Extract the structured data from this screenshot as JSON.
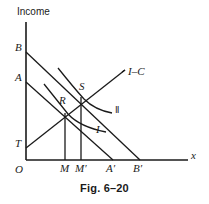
{
  "figure": {
    "caption": "Fig. 6–20",
    "axis_y_title": "Income",
    "axis_x_title": "x",
    "curve_labels": {
      "ic_line": "I–C",
      "indifference_one": "I",
      "indifference_two": "Ⅱ"
    },
    "points": [
      {
        "id": "B",
        "label": "B",
        "x": 15,
        "y": 48
      },
      {
        "id": "A",
        "label": "A",
        "x": 15,
        "y": 78
      },
      {
        "id": "T",
        "label": "T",
        "x": 15,
        "y": 144
      },
      {
        "id": "O",
        "label": "O",
        "x": 15,
        "y": 170
      },
      {
        "id": "S",
        "label": "S",
        "x": 79,
        "y": 87
      },
      {
        "id": "R",
        "label": "R",
        "x": 59,
        "y": 101
      },
      {
        "id": "M",
        "label": "M",
        "x": 60,
        "y": 169
      },
      {
        "id": "Mp",
        "label": "M′",
        "x": 76,
        "y": 169
      },
      {
        "id": "Ap",
        "label": "A′",
        "x": 107,
        "y": 169
      },
      {
        "id": "Bp",
        "label": "B′",
        "x": 134,
        "y": 169
      }
    ],
    "geometry": {
      "origin": {
        "x": 26,
        "y": 160
      },
      "y_axis_top": 22,
      "x_axis_right": 188,
      "budget_line_B": {
        "x1": 26,
        "y1": 52,
        "x2": 140,
        "y2": 160
      },
      "budget_line_A": {
        "x1": 26,
        "y1": 82,
        "x2": 113,
        "y2": 160
      },
      "ic_line": {
        "x1": 26,
        "y1": 148,
        "x2": 125,
        "y2": 70
      },
      "vertical_M": {
        "x": 65,
        "y_top": 113,
        "y_bottom": 160
      },
      "vertical_Mprime": {
        "x": 81,
        "y_top": 97,
        "y_bottom": 160
      },
      "point_R": {
        "x": 65,
        "y": 113
      },
      "point_S": {
        "x": 81,
        "y": 97
      }
    },
    "colors": {
      "line": "#1a1a1a",
      "background": "#ffffff",
      "text": "#1a1a1a"
    }
  }
}
